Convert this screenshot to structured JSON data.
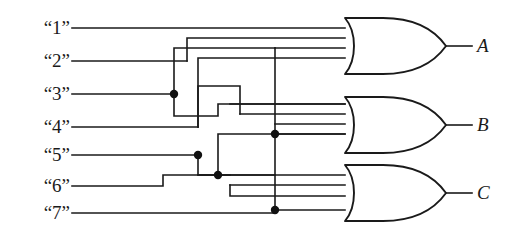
{
  "diagram": {
    "type": "logic-circuit",
    "gate_type": "OR",
    "line_color": "#1a1a1a",
    "background": "#ffffff"
  },
  "inputs": [
    {
      "label": "“1”",
      "y": 28
    },
    {
      "label": "“2”",
      "y": 61
    },
    {
      "label": "“3”",
      "y": 94
    },
    {
      "label": "“4”",
      "y": 127
    },
    {
      "label": "“5”",
      "y": 155
    },
    {
      "label": "“6”",
      "y": 186
    },
    {
      "label": "“7”",
      "y": 213
    }
  ],
  "outputs": [
    {
      "label": "A",
      "y": 46
    },
    {
      "label": "B",
      "y": 125
    },
    {
      "label": "C",
      "y": 193
    }
  ],
  "gates": [
    {
      "name": "or-gate-a",
      "output": "A",
      "inputs": 4,
      "cy": 46
    },
    {
      "name": "or-gate-b",
      "output": "B",
      "inputs": 4,
      "cy": 125
    },
    {
      "name": "or-gate-c",
      "output": "C",
      "inputs": 4,
      "cy": 193
    }
  ],
  "junctions": [
    {
      "name": "junction-3",
      "x": 174,
      "y": 94
    },
    {
      "name": "junction-5",
      "x": 198,
      "y": 155
    },
    {
      "name": "junction-6",
      "x": 218,
      "y": 175
    },
    {
      "name": "junction-bus-b",
      "x": 275,
      "y": 134
    },
    {
      "name": "junction-bus-c",
      "x": 275,
      "y": 210
    }
  ]
}
